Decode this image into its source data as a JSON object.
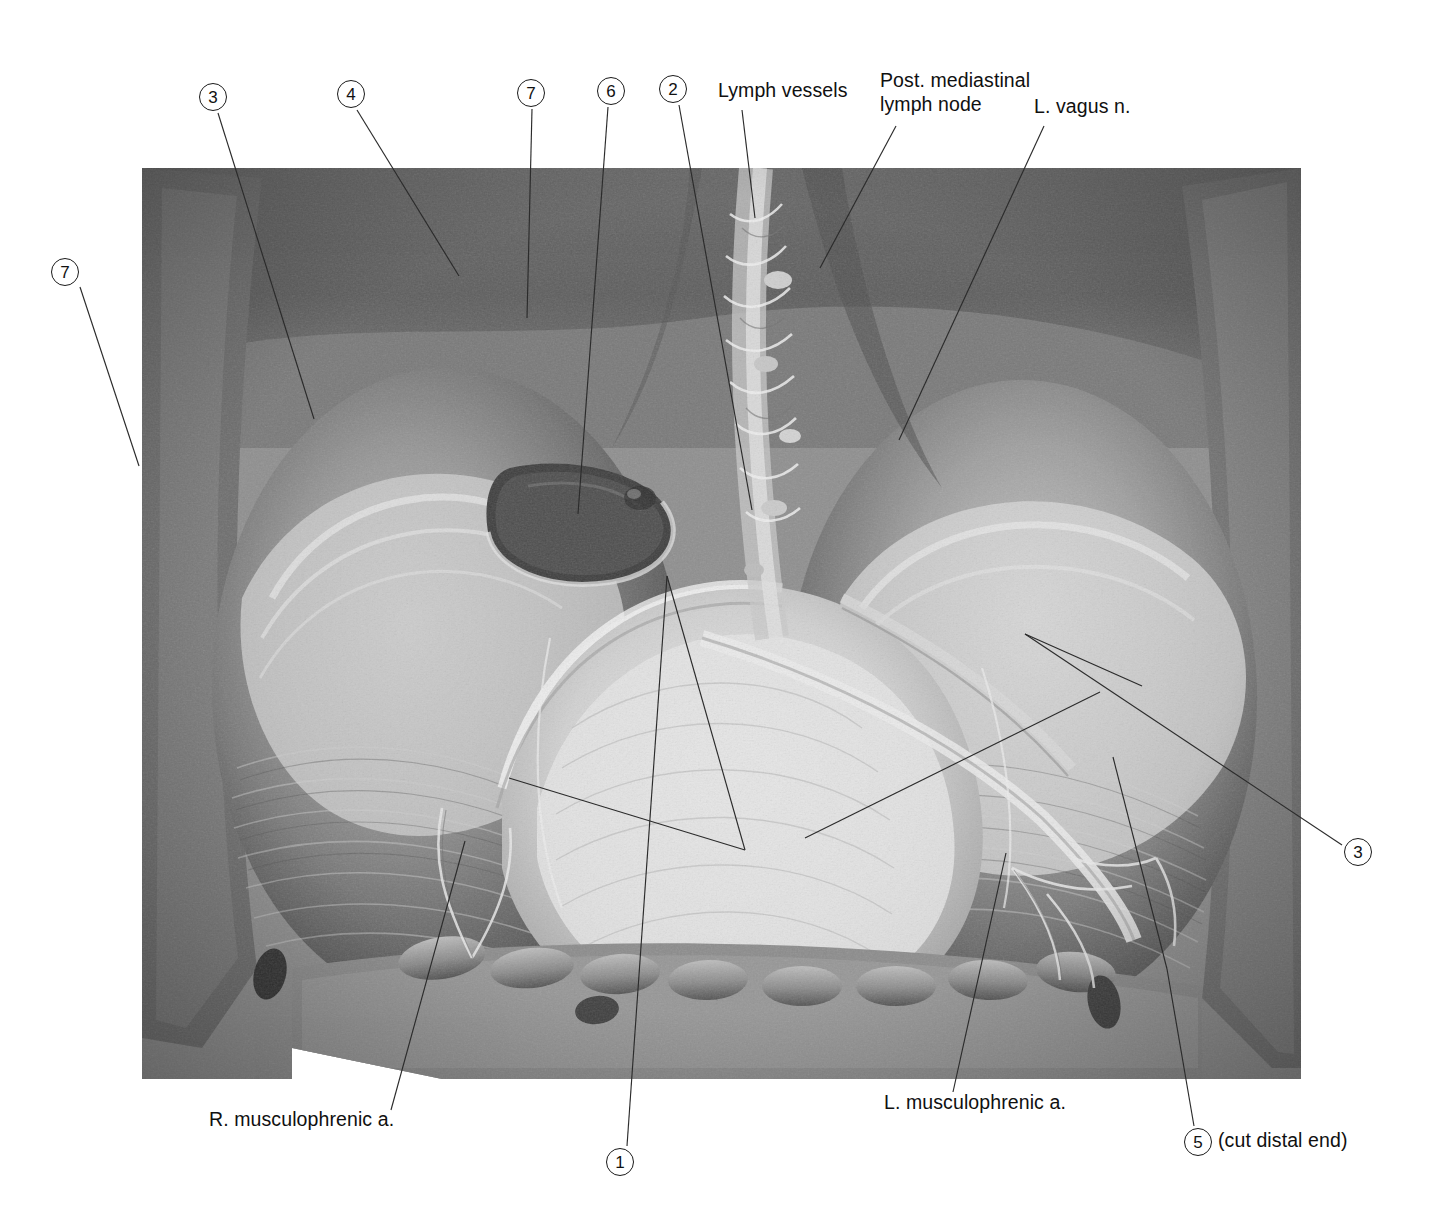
{
  "figure": {
    "kind": "anatomical-dissection-photograph",
    "background_color": "#ffffff",
    "ink_color": "#111111",
    "photo": {
      "left": 142,
      "top": 168,
      "width": 1159,
      "height": 911,
      "tone": "grayscale"
    }
  },
  "callouts": [
    {
      "id": "c3-top",
      "label": "3",
      "x": 213,
      "y": 97,
      "leader": [
        [
          218,
          113
        ],
        [
          314,
          419
        ]
      ]
    },
    {
      "id": "c4-top",
      "label": "4",
      "x": 351,
      "y": 94,
      "leader": [
        [
          357,
          110
        ],
        [
          459,
          276
        ]
      ]
    },
    {
      "id": "c7-top",
      "label": "7",
      "x": 531,
      "y": 93,
      "leader": [
        [
          532,
          109
        ],
        [
          527,
          318
        ]
      ]
    },
    {
      "id": "c6-top",
      "label": "6",
      "x": 611,
      "y": 91,
      "leader": [
        [
          608,
          107
        ],
        [
          578,
          514
        ]
      ]
    },
    {
      "id": "c2-top",
      "label": "2",
      "x": 673,
      "y": 89,
      "leader": [
        [
          679,
          105
        ],
        [
          752,
          510
        ]
      ]
    },
    {
      "id": "c7-left",
      "label": "7",
      "x": 65,
      "y": 272,
      "leader": [
        [
          80,
          287
        ],
        [
          139,
          466
        ]
      ]
    },
    {
      "id": "c3-right",
      "label": "3",
      "x": 1358,
      "y": 852,
      "leader": [
        [
          1342,
          845
        ],
        [
          1025,
          634
        ]
      ]
    },
    {
      "id": "c1-bottom",
      "label": "1",
      "x": 620,
      "y": 1162,
      "leader": [
        [
          627,
          1146
        ],
        [
          667,
          576
        ]
      ]
    },
    {
      "id": "c5-bottom",
      "label": "5",
      "x": 1198,
      "y": 1142,
      "leader": [
        [
          1194,
          1126
        ],
        [
          1167,
          969
        ]
      ]
    }
  ],
  "text_labels": [
    {
      "id": "lymph-vessels",
      "text": "Lymph vessels",
      "x": 718,
      "y": 84,
      "align": "left",
      "leader": [
        [
          742,
          110
        ],
        [
          755,
          218
        ]
      ]
    },
    {
      "id": "post-mediastinal-lymph-node",
      "line1": "Post. mediastinal",
      "line2": "lymph node",
      "text": "Post. mediastinal lymph node",
      "x": 880,
      "y": 74,
      "align": "left",
      "leader": [
        [
          896,
          126
        ],
        [
          820,
          268
        ]
      ]
    },
    {
      "id": "l-vagus-n",
      "text": "L. vagus n.",
      "x": 1034,
      "y": 100,
      "align": "left",
      "leader": [
        [
          1044,
          126
        ],
        [
          899,
          440
        ]
      ]
    },
    {
      "id": "r-musculophrenic-a",
      "text": "R. musculophrenic a.",
      "x": 209,
      "y": 1113,
      "align": "left",
      "leader": [
        [
          391,
          1110
        ],
        [
          465,
          841
        ]
      ]
    },
    {
      "id": "l-musculophrenic-a",
      "text": "L. musculophrenic a.",
      "x": 884,
      "y": 1096,
      "align": "left",
      "leader": [
        [
          953,
          1092
        ],
        [
          1006,
          853
        ]
      ]
    },
    {
      "id": "cut-distal-end",
      "text": "(cut distal end)",
      "x": 1218,
      "y": 1130,
      "align": "left",
      "leader": null
    }
  ]
}
